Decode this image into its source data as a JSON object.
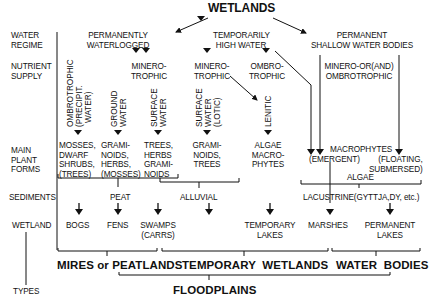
{
  "title": "WETLANDS",
  "row_labels": {
    "water_regime": [
      "WATER",
      "REGIME"
    ],
    "nutrient_supply": [
      "NUTRIENT",
      "SUPPLY"
    ],
    "main_plant_forms": [
      "MAIN",
      "PLANT",
      "FORMS"
    ],
    "sediments": "SEDIMENTS",
    "wetland": "WETLAND",
    "types": "TYPES"
  },
  "water_regime": {
    "permanently_waterlogged": [
      "PERMANENTLY",
      "WATERLOGGED"
    ],
    "temporarily_high_water": [
      "TEMPORARILY",
      "HIGH WATER"
    ],
    "permanent_shallow": [
      "PERMANENT",
      "SHALLOW WATER BODIES"
    ]
  },
  "nutrient_supply": {
    "minerotrophic_1": [
      "MINERO-",
      "TROPHIC"
    ],
    "minerotrophic_2": [
      "MINERO-",
      "TROPHIC"
    ],
    "ombrotrophic": [
      "OMBRO-",
      "TROPHIC"
    ],
    "minero_or_ombro": [
      "MINERO-OR(AND)",
      "OMBROTROPHIC"
    ]
  },
  "water_source": {
    "ombrotrophic_precip": [
      "OMBROTROPHIC",
      "(PRECIPIT.",
      "WATER)"
    ],
    "ground_water": [
      "GROUND",
      "WATER"
    ],
    "surface_water_1": [
      "SURFACE",
      "WATER"
    ],
    "surface_water_lotic": [
      "SURFACE",
      "WATER",
      "(LOTIC)"
    ],
    "lenitic": [
      "LENITIC"
    ]
  },
  "plant_forms": {
    "mosses": [
      "MOSSES,",
      "DWARF",
      "SHRUBS,",
      "(TREES)"
    ],
    "graminoids_herbs": [
      "GRAMI-",
      "NOIDS,",
      "HERBS,",
      "(MOSSES)"
    ],
    "trees_herbs": [
      "TREES,",
      "HERBS",
      "GRAMI-",
      "NOIDS"
    ],
    "graminoids_trees": [
      "GRAMI-",
      "NOIDS,",
      "TREES"
    ],
    "algae_macrophytes": [
      "ALGAE",
      "MACRO-",
      "PHYTES"
    ],
    "macrophytes": "MACROPHYTES",
    "emergent": "(EMERGENT)",
    "floating": [
      "(FLOATING,",
      "SUBMERSED)"
    ],
    "algae": "ALGAE"
  },
  "sediments": {
    "peat": "PEAT",
    "alluvial": "ALLUVIAL",
    "lacustrine": "LACUSTRINE(GYTTJA,DY, etc.)"
  },
  "wetlands": {
    "bogs": "BOGS",
    "fens": "FENS",
    "swamps": [
      "SWAMPS",
      "(CARRS)"
    ],
    "temporary_lakes": [
      "TEMPORARY",
      "LAKES"
    ],
    "marshes": "MARSHES",
    "permanent_lakes": [
      "PERMANENT",
      "LAKES"
    ]
  },
  "types": {
    "mires": "MIRES or PEATLANDS",
    "temporary_wetlands": "TEMPORARY  WETLANDS",
    "water_bodies": "WATER  BODIES",
    "floodplains": "FLOODPLAINS"
  }
}
